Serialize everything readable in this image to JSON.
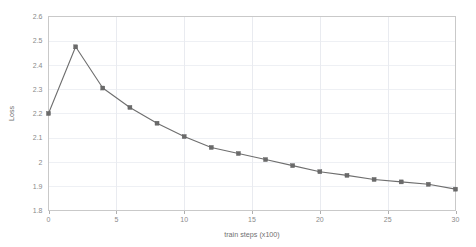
{
  "chart_data": {
    "type": "line",
    "title": "",
    "xlabel": "train steps (x100)",
    "ylabel": "Loss",
    "xlim": [
      0,
      30
    ],
    "ylim": [
      1.8,
      2.6
    ],
    "grid": true,
    "legend": "none",
    "xticks": [
      0,
      5,
      10,
      15,
      20,
      25,
      30
    ],
    "xtick_labels": [
      "0",
      "5",
      "10",
      "15",
      "20",
      "25",
      "30"
    ],
    "yticks": [
      1.8,
      1.9,
      2.0,
      2.1,
      2.2,
      2.3,
      2.4,
      2.5,
      2.6
    ],
    "ytick_labels": [
      "1.8",
      "1.9",
      "2",
      "2.1",
      "2.2",
      "2.3",
      "2.4",
      "2.5",
      "2.6"
    ],
    "series": [
      {
        "name": "Loss",
        "color": "#6e6e6e",
        "marker": "square",
        "x": [
          0,
          2,
          4,
          6,
          8,
          10,
          12,
          14,
          16,
          18,
          20,
          22,
          24,
          26,
          28,
          30
        ],
        "values": [
          2.2,
          2.475,
          2.305,
          2.225,
          2.16,
          2.105,
          2.06,
          2.035,
          2.01,
          1.985,
          1.96,
          1.945,
          1.928,
          1.918,
          1.908,
          1.888
        ]
      }
    ]
  }
}
